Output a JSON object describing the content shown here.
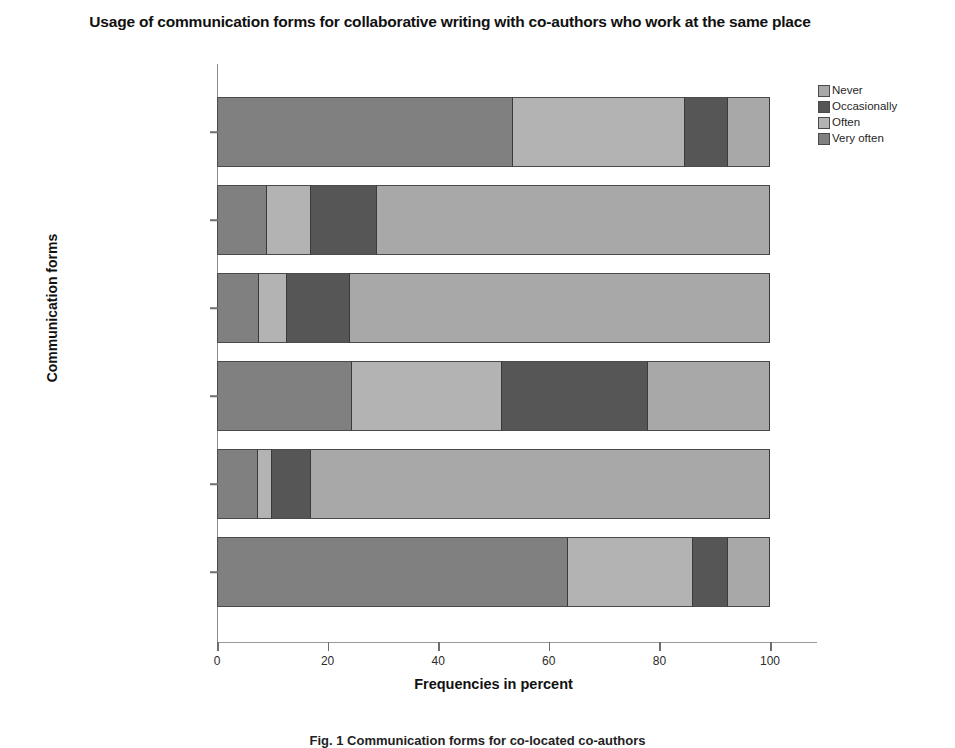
{
  "chart_data": {
    "type": "bar",
    "orientation": "horizontal",
    "stacked": true,
    "stacked_mode": "percent",
    "title": "Usage of communication forms for collaborative writing with co-authors who work at the same place",
    "xlabel": "Frequencies in percent",
    "ylabel": "Communication forms",
    "xlim": [
      0,
      100
    ],
    "xticks": [
      0,
      20,
      40,
      60,
      80,
      100
    ],
    "xticklabels": [
      "0",
      "20",
      "40",
      "60",
      "80",
      "100"
    ],
    "grid": false,
    "legend_position": "right",
    "categories": [
      "Email",
      "Chat / Instant messaging",
      "VoIP (e.g. Skype)",
      "Telephone",
      "Video conferencing",
      "Face-to-face meetings"
    ],
    "series": [
      {
        "name": "Very often",
        "color": "#808080",
        "values": [
          53.5,
          9.0,
          7.6,
          24.5,
          7.4,
          63.5
        ]
      },
      {
        "name": "Often",
        "color": "#b3b3b3",
        "values": [
          31.1,
          8.0,
          5.0,
          27.0,
          2.6,
          22.5
        ]
      },
      {
        "name": "Occasionally",
        "color": "#565656",
        "values": [
          7.8,
          12.0,
          11.4,
          26.5,
          7.0,
          6.4
        ]
      },
      {
        "name": "Never",
        "color": "#a8a8a8",
        "values": [
          7.6,
          71.0,
          76.0,
          22.0,
          83.0,
          7.6
        ]
      }
    ]
  },
  "legend": {
    "items": [
      {
        "label": "Never",
        "color": "#a8a8a8"
      },
      {
        "label": "Occasionally",
        "color": "#565656"
      },
      {
        "label": "Often",
        "color": "#b3b3b3"
      },
      {
        "label": "Very often",
        "color": "#808080"
      }
    ]
  },
  "caption": "Fig. 1 Communication forms for co-located co-authors"
}
